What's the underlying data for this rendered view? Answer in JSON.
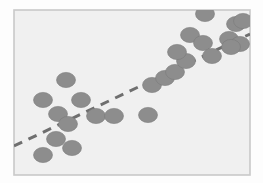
{
  "figure": {
    "type": "scatter-plot-illustration",
    "background_color": "#fdfdfd",
    "has_axis_labels": false,
    "has_tick_labels": false,
    "has_title": false,
    "has_legend": false
  },
  "frame": {
    "x": 14,
    "y": 10,
    "width": 236,
    "height": 165,
    "fill_color": "#f0f0f0",
    "border_color": "#c9c9c9",
    "border_width": 1.6
  },
  "chart_data": {
    "type": "scatter",
    "title": "",
    "xlabel": "",
    "ylabel": "",
    "xlim": [
      0,
      100
    ],
    "ylim": [
      0,
      100
    ],
    "grid": false,
    "legend_position": "none",
    "point_color": "#8d8d8d",
    "point_edge_color": "#7b7b7b",
    "point_marker": "ellipse",
    "point_radius_x": 9.5,
    "point_radius_y": 7.6,
    "relationship": "positive-linear-correlation",
    "n_points": 25,
    "points": [
      {
        "x": 66,
        "y": 80
      },
      {
        "x": 43,
        "y": 100
      },
      {
        "x": 81,
        "y": 100
      },
      {
        "x": 58,
        "y": 114
      },
      {
        "x": 68,
        "y": 124
      },
      {
        "x": 96,
        "y": 116
      },
      {
        "x": 114,
        "y": 116
      },
      {
        "x": 148,
        "y": 115
      },
      {
        "x": 56,
        "y": 139
      },
      {
        "x": 72,
        "y": 148
      },
      {
        "x": 43,
        "y": 155
      },
      {
        "x": 152,
        "y": 85
      },
      {
        "x": 165,
        "y": 78
      },
      {
        "x": 175,
        "y": 72
      },
      {
        "x": 186,
        "y": 61
      },
      {
        "x": 177,
        "y": 52
      },
      {
        "x": 190,
        "y": 35
      },
      {
        "x": 203,
        "y": 43
      },
      {
        "x": 205,
        "y": 14
      },
      {
        "x": 212,
        "y": 56
      },
      {
        "x": 229,
        "y": 39
      },
      {
        "x": 236,
        "y": 24
      },
      {
        "x": 243,
        "y": 21
      },
      {
        "x": 240,
        "y": 44
      },
      {
        "x": 231,
        "y": 47
      }
    ],
    "trend_line": {
      "style": "dashed",
      "color": "#6f6f6f",
      "width": 3.0,
      "dash_pattern": "9 7",
      "x1": 14,
      "y1": 146,
      "x2": 250,
      "y2": 34
    }
  }
}
